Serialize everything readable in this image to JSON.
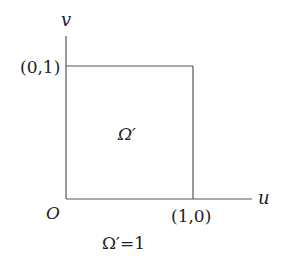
{
  "diagram": {
    "axes": {
      "x_label": "u",
      "y_label": "v",
      "origin_label": "O"
    },
    "points": {
      "top_left": "(0,1)",
      "bottom_right": "(1,0)"
    },
    "region": {
      "label": "Ω′",
      "shape": "unit square"
    },
    "caption": "Ω′=1",
    "colors": {
      "line": "#555555",
      "text": "#222222",
      "background": "#ffffff"
    }
  }
}
